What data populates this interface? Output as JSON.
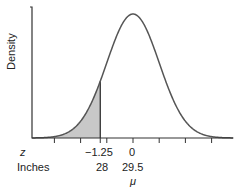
{
  "chart_data": {
    "type": "area",
    "title": "",
    "xlabel": "",
    "ylabel": "Density",
    "distribution": "normal",
    "mean_inches": 29.5,
    "shaded_region": {
      "from_z": "-inf",
      "to_z": -1.25,
      "to_inches": 28
    },
    "z_ticks": [
      -3,
      -2,
      -1,
      0,
      1,
      2,
      3
    ],
    "labeled_ticks": [
      {
        "z": -1.25,
        "z_label": "−1.25",
        "inches_label": "28"
      },
      {
        "z": 0,
        "z_label": "0",
        "inches_label": "29.5",
        "annotation": "μ"
      }
    ],
    "row_labels": {
      "z": "z",
      "inches": "Inches"
    },
    "grid": false,
    "colors": {
      "curve": "#555555",
      "shade": "#c8c8c8",
      "axis": "#333333"
    }
  }
}
